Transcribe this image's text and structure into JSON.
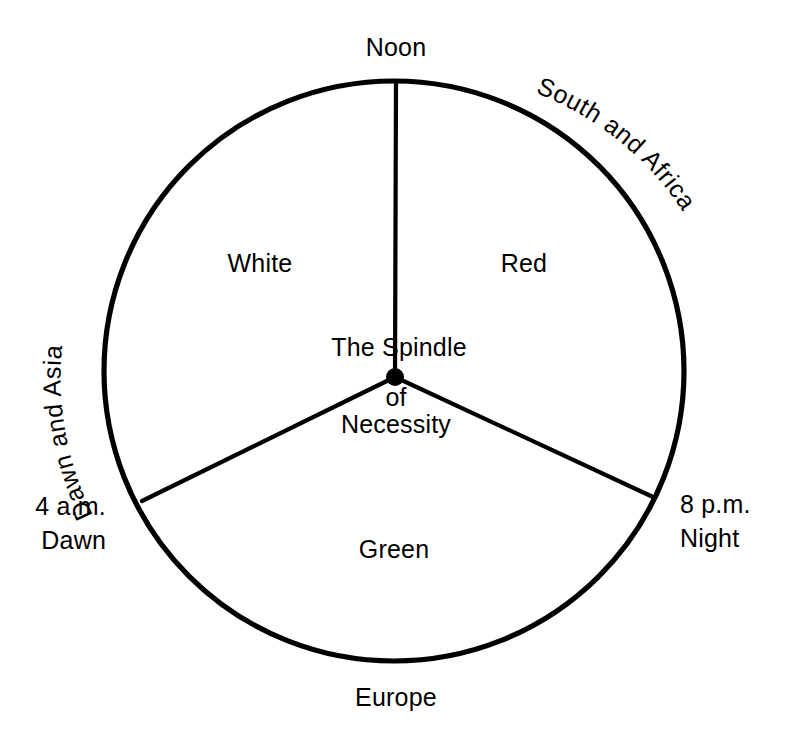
{
  "diagram": {
    "title": "The Spindle of Necessity",
    "type": "three-sector-circle",
    "colors": {
      "stroke": "#000000",
      "background": "#ffffff",
      "text": "#000000"
    },
    "geometry": {
      "center_x": 394,
      "center_y": 371,
      "radius": 290,
      "spoke_angles_deg": [
        90,
        210,
        330
      ]
    },
    "center_labels": {
      "line1": "The Spindle",
      "line2": "of",
      "line3": "Necessity"
    },
    "sectors": [
      {
        "id": "white",
        "label": "White",
        "x": 260,
        "y": 272
      },
      {
        "id": "red",
        "label": "Red",
        "x": 524,
        "y": 272
      },
      {
        "id": "green",
        "label": "Green",
        "x": 394,
        "y": 558
      }
    ],
    "rim_labels": [
      {
        "id": "noon",
        "label": "Noon",
        "x": 396,
        "y": 56,
        "anchor": "middle"
      },
      {
        "id": "europe",
        "label": "Europe",
        "x": 396,
        "y": 706,
        "anchor": "middle"
      }
    ],
    "curved_labels": [
      {
        "id": "dawn-and-asia",
        "label": "Dawn and Asia"
      },
      {
        "id": "south-and-africa",
        "label": "South and Africa"
      }
    ],
    "time_markers": [
      {
        "id": "four-am-dawn",
        "line1": "4 a.m.",
        "line2": "Dawn",
        "x": 106,
        "y1": 515,
        "y2": 549,
        "anchor": "end"
      },
      {
        "id": "eight-pm-night",
        "line1": "8 p.m.",
        "line2": "Night",
        "x": 680,
        "y1": 513,
        "y2": 547,
        "anchor": "start"
      }
    ],
    "spindle_point": {
      "label": "spindle-dot",
      "x": 395,
      "y": 377,
      "r": 9
    }
  }
}
